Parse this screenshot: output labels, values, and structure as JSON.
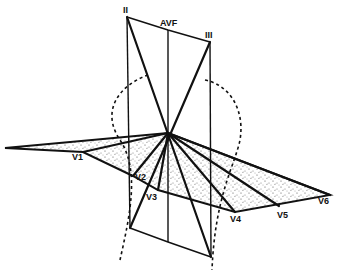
{
  "diagram": {
    "frontal_labels": {
      "lead_ii": "II",
      "lead_avf": "AVF",
      "lead_iii": "III"
    },
    "precordial_labels": [
      "V1",
      "V2",
      "V3",
      "V4",
      "V5",
      "V6"
    ],
    "colors": {
      "ink": "#111111",
      "background": "#ffffff",
      "stipple": "#555555"
    }
  }
}
